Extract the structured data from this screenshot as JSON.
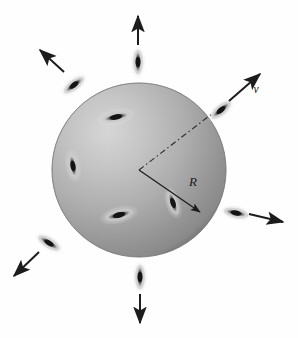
{
  "figure": {
    "name": "expanding-sphere-of-galaxies",
    "width": 298,
    "height": 338,
    "background_color": "#ffffff",
    "sphere": {
      "center_x": 139,
      "center_y": 170,
      "radius": 87,
      "highlight_color": "#d2d2d2",
      "mid_color": "#b0b0b0",
      "edge_color": "#858585",
      "rim_color": "#6f6f6f",
      "highlight_offset_x": "32%",
      "highlight_offset_y": "28%"
    },
    "radius_marker": {
      "label": "R",
      "label_x": 193,
      "label_y": 186,
      "line_color": "#1c1c1c",
      "from_x": 139,
      "from_y": 170,
      "to_x": 200,
      "to_y": 212,
      "style": "solid-arrow"
    },
    "dashed_radius": {
      "from_x": 139,
      "from_y": 170,
      "to_x": 213,
      "to_y": 113,
      "line_color": "#2a2a2a",
      "style": "dash-dot"
    },
    "velocity_marker": {
      "label": "v",
      "label_x": 256,
      "label_y": 93,
      "line_color": "#1c1c1c",
      "from_x": 221,
      "from_y": 110,
      "to_x": 259,
      "to_y": 74,
      "style": "solid-arrow"
    },
    "galaxies_inside": [
      {
        "cx": 116,
        "cy": 117,
        "rx": 13,
        "ry": 3.4,
        "angle": -12
      },
      {
        "cx": 73,
        "cy": 166,
        "rx": 11,
        "ry": 3.2,
        "angle": 80
      },
      {
        "cx": 119,
        "cy": 215,
        "rx": 13,
        "ry": 3.6,
        "angle": -14
      },
      {
        "cx": 173,
        "cy": 203,
        "rx": 11,
        "ry": 3.2,
        "angle": 72
      }
    ],
    "galaxies_on_surface": [
      {
        "cx": 138,
        "cy": 62,
        "rx": 11,
        "ry": 3.2,
        "angle": 90,
        "arrow_angle": -90
      },
      {
        "cx": 74,
        "cy": 85,
        "rx": 11,
        "ry": 3.2,
        "angle": -38,
        "arrow_angle": -142
      },
      {
        "cx": 221,
        "cy": 110,
        "rx": 11,
        "ry": 3.2,
        "angle": -40,
        "arrow_angle": -40
      },
      {
        "cx": 49,
        "cy": 243,
        "rx": 11,
        "ry": 3.2,
        "angle": 32,
        "arrow_angle": 148
      },
      {
        "cx": 236,
        "cy": 213,
        "rx": 11,
        "ry": 3.2,
        "angle": 12,
        "arrow_angle": 16
      },
      {
        "cx": 140,
        "cy": 277,
        "rx": 11,
        "ry": 3.2,
        "angle": 90,
        "arrow_angle": 90
      }
    ],
    "arrows": [
      {
        "name": "arrow-up",
        "x1": 138,
        "y1": 45,
        "x2": 138,
        "y2": 16
      },
      {
        "name": "arrow-upper-left",
        "x1": 64,
        "y1": 72,
        "x2": 40,
        "y2": 50
      },
      {
        "name": "arrow-upper-right",
        "x1": 229,
        "y1": 101,
        "x2": 260,
        "y2": 74
      },
      {
        "name": "arrow-lower-left",
        "x1": 39,
        "y1": 252,
        "x2": 14,
        "y2": 276
      },
      {
        "name": "arrow-right",
        "x1": 249,
        "y1": 214,
        "x2": 283,
        "y2": 222
      },
      {
        "name": "arrow-down",
        "x1": 140,
        "y1": 294,
        "x2": 140,
        "y2": 323
      }
    ],
    "caption_text": ""
  }
}
